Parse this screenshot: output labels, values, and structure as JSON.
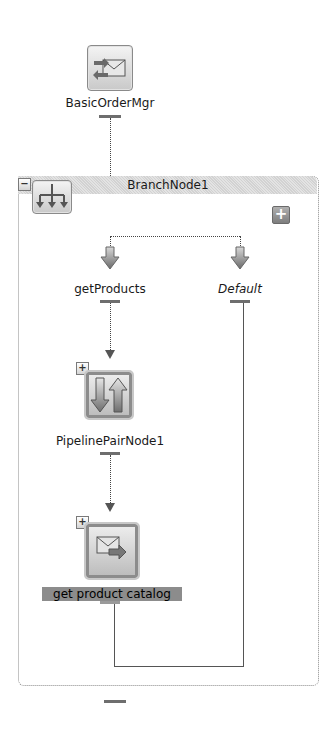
{
  "nodes": {
    "proxy": {
      "label": "BasicOrderMgr",
      "icon": "proxy-service-envelope-icon"
    },
    "branch": {
      "label": "BranchNode1",
      "collapse_symbol": "−",
      "add_symbol": "+",
      "icon": "branch-tree-icon"
    },
    "branches": [
      {
        "label": "getProducts",
        "italic": false
      },
      {
        "label": "Default",
        "italic": true
      }
    ],
    "pipeline": {
      "label": "PipelinePairNode1",
      "expand_symbol": "+",
      "icon": "pipeline-pair-arrows-icon"
    },
    "route": {
      "label": "get product catalog",
      "expand_symbol": "+",
      "icon": "route-envelope-icon",
      "selected": true
    }
  },
  "colors": {
    "line": "#555555",
    "port": "#6e6e6e",
    "selection_bg": "#8c8c8c",
    "frame_border": "#8a8a8a"
  }
}
